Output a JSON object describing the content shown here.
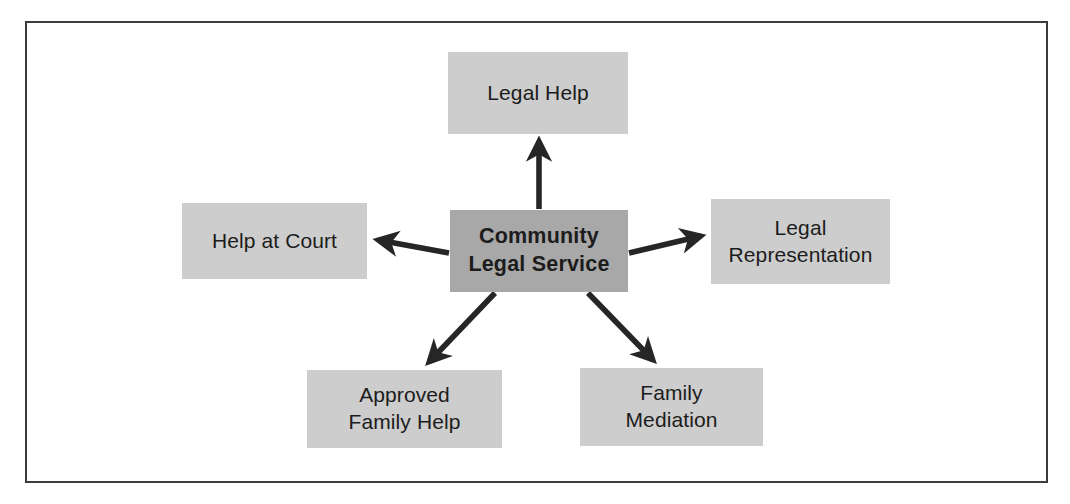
{
  "diagram": {
    "frame": {
      "border_color": "#3a3c40",
      "background": "#ffffff"
    },
    "hub": {
      "id": "community-legal-service",
      "label": "Community\nLegal Service",
      "line1": "Community",
      "line2": "Legal Service",
      "fill": "#a8a8a8",
      "text_color": "#1c1c1c",
      "bold": true
    },
    "branches": [
      {
        "id": "legal-help",
        "label": "Legal Help",
        "position": "top",
        "fill": "#cdcdcd",
        "text_color": "#1c1c1c"
      },
      {
        "id": "help-at-court",
        "label": "Help at Court",
        "position": "left",
        "fill": "#cdcdcd",
        "text_color": "#1c1c1c"
      },
      {
        "id": "legal-representation",
        "label": "Legal\nRepresentation",
        "position": "right",
        "fill": "#cdcdcd",
        "text_color": "#1c1c1c"
      },
      {
        "id": "approved-family-help",
        "label": "Approved\nFamily Help",
        "position": "bottom-left",
        "fill": "#cdcdcd",
        "text_color": "#1c1c1c"
      },
      {
        "id": "family-mediation",
        "label": "Family\nMediation",
        "position": "bottom-right",
        "fill": "#cdcdcd",
        "text_color": "#1c1c1c"
      }
    ],
    "connectors": [
      {
        "id": "arrow-to-legal-help",
        "from": "community-legal-service",
        "to": "legal-help",
        "direction": "up",
        "color": "#262626"
      },
      {
        "id": "arrow-to-help-at-court",
        "from": "community-legal-service",
        "to": "help-at-court",
        "direction": "left",
        "color": "#262626"
      },
      {
        "id": "arrow-to-legal-representation",
        "from": "community-legal-service",
        "to": "legal-representation",
        "direction": "right",
        "color": "#262626"
      },
      {
        "id": "arrow-to-approved-family-help",
        "from": "community-legal-service",
        "to": "approved-family-help",
        "direction": "down-left",
        "color": "#262626"
      },
      {
        "id": "arrow-to-family-mediation",
        "from": "community-legal-service",
        "to": "family-mediation",
        "direction": "down-right",
        "color": "#262626"
      }
    ]
  }
}
